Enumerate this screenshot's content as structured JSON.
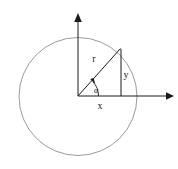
{
  "figure": {
    "background_color": "#ffffff",
    "stroke_color_circle": "#888888",
    "stroke_color_lines": "#1a1a1a",
    "canvas": {
      "width": 178,
      "height": 169
    }
  },
  "geometry": {
    "origin": {
      "x": 78,
      "y": 96
    },
    "circle": {
      "cx": 78,
      "cy": 96.5,
      "r": 59
    },
    "point_on_circle": {
      "x": 120,
      "y": 49
    },
    "x_axis": {
      "x1": 78,
      "y1": 96,
      "x2": 170,
      "y2": 96
    },
    "y_axis": {
      "x1": 78,
      "y1": 96,
      "x2": 78,
      "y2": 14
    },
    "radius_segment": {
      "x1": 78,
      "y1": 96,
      "x2": 120,
      "y2": 49
    },
    "vertical_leg": {
      "x1": 121,
      "y1": 49,
      "x2": 121,
      "y2": 96
    },
    "angle_arc_radius": 20
  },
  "labels": {
    "radius": {
      "text": "r",
      "x": 94,
      "y": 62
    },
    "vertical": {
      "text": "y",
      "x": 121,
      "y": 78
    },
    "horizontal": {
      "text": "x",
      "x": 100,
      "y": 108
    },
    "angle": {
      "text": "α",
      "x": 95,
      "y": 93
    }
  },
  "markers": {
    "x_axis_arrow": "arrowhead-right",
    "y_axis_arrow": "arrowhead-up",
    "angle_arrow": "arrowhead-arc"
  }
}
